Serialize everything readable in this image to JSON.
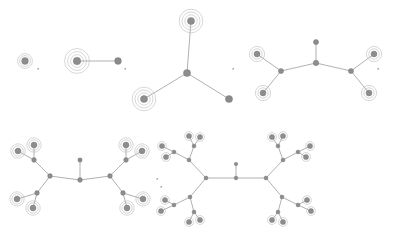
{
  "figure": {
    "kind": "graph-sequence",
    "background": "#ffffff",
    "node_color": "#8d8d8d",
    "node_stroke": "#6f6f6f",
    "edge_color": "#8f8f8f",
    "halo_color": "#b6b6b6",
    "comma_color": "#6a6a6a",
    "separator": ",",
    "width": 402,
    "height": 231
  },
  "separators": [
    {
      "name": "comma-1",
      "x": 37,
      "y": 62,
      "text": ","
    },
    {
      "name": "comma-2",
      "x": 124,
      "y": 62,
      "text": ","
    },
    {
      "name": "comma-3",
      "x": 232,
      "y": 62,
      "text": ","
    },
    {
      "name": "comma-4",
      "x": 377,
      "y": 62,
      "text": ","
    },
    {
      "name": "comma-5",
      "x": 160,
      "y": 180,
      "text": ","
    },
    {
      "name": "comma-6",
      "x": 156,
      "y": 172,
      "text": ","
    }
  ],
  "graphs": [
    {
      "name": "graph-1-single-haloed-node",
      "nodes": [
        {
          "x": 25,
          "y": 61,
          "r": 3.4,
          "halos": [
            5.4,
            7.4
          ],
          "type": "leaf"
        }
      ],
      "edges": []
    },
    {
      "name": "graph-2-two-node-edge",
      "nodes": [
        {
          "x": 77,
          "y": 61,
          "r": 3.8,
          "halos": [
            6.4,
            9.4,
            12.4
          ],
          "type": "leaf"
        },
        {
          "x": 118,
          "y": 61,
          "r": 3.4,
          "halos": [],
          "type": "plain"
        }
      ],
      "edges": [
        [
          0,
          1
        ]
      ]
    },
    {
      "name": "graph-3-three-branch-star",
      "nodes": [
        {
          "x": 187,
          "y": 73,
          "r": 3.6,
          "halos": [],
          "type": "center"
        },
        {
          "x": 191,
          "y": 21,
          "r": 3.6,
          "halos": [
            6.2,
            9.0,
            11.8
          ],
          "type": "leaf"
        },
        {
          "x": 144,
          "y": 99,
          "r": 3.6,
          "halos": [
            6.2,
            9.0,
            11.8
          ],
          "type": "leaf"
        },
        {
          "x": 229,
          "y": 99,
          "r": 3.6,
          "halos": [],
          "type": "plain"
        }
      ],
      "edges": [
        [
          0,
          1
        ],
        [
          0,
          2
        ],
        [
          0,
          3
        ]
      ]
    },
    {
      "name": "graph-4-caterpillar-seven-node",
      "nodes": [
        {
          "x": 316,
          "y": 63,
          "r": 2.8,
          "halos": [],
          "type": "center"
        },
        {
          "x": 316,
          "y": 42,
          "r": 2.6,
          "halos": [],
          "type": "plain"
        },
        {
          "x": 281,
          "y": 71,
          "r": 2.6,
          "halos": [],
          "type": "branch"
        },
        {
          "x": 351,
          "y": 71,
          "r": 2.6,
          "halos": [],
          "type": "branch"
        },
        {
          "x": 257,
          "y": 54,
          "r": 3.0,
          "halos": [
            5.2,
            7.6
          ],
          "type": "leaf"
        },
        {
          "x": 263,
          "y": 93,
          "r": 3.0,
          "halos": [
            5.2,
            7.6
          ],
          "type": "leaf"
        },
        {
          "x": 374,
          "y": 54,
          "r": 3.0,
          "halos": [
            5.2,
            7.6
          ],
          "type": "leaf"
        },
        {
          "x": 369,
          "y": 93,
          "r": 3.0,
          "halos": [
            5.2,
            7.6
          ],
          "type": "leaf"
        }
      ],
      "edges": [
        [
          0,
          1
        ],
        [
          0,
          2
        ],
        [
          0,
          3
        ],
        [
          2,
          4
        ],
        [
          2,
          5
        ],
        [
          3,
          6
        ],
        [
          3,
          7
        ]
      ]
    },
    {
      "name": "graph-5-symmetric-tree-depth-two",
      "nodes": [
        {
          "x": 80,
          "y": 180,
          "r": 2.4,
          "halos": [],
          "type": "center"
        },
        {
          "x": 80,
          "y": 160,
          "r": 2.2,
          "halos": [],
          "type": "plain"
        },
        {
          "x": 50,
          "y": 176,
          "r": 2.4,
          "halos": [],
          "type": "branch"
        },
        {
          "x": 110,
          "y": 176,
          "r": 2.4,
          "halos": [],
          "type": "branch"
        },
        {
          "x": 34,
          "y": 160,
          "r": 2.4,
          "halos": [],
          "type": "branch"
        },
        {
          "x": 37,
          "y": 193,
          "r": 2.4,
          "halos": [],
          "type": "branch"
        },
        {
          "x": 126,
          "y": 160,
          "r": 2.4,
          "halos": [],
          "type": "branch"
        },
        {
          "x": 123,
          "y": 193,
          "r": 2.4,
          "halos": [],
          "type": "branch"
        },
        {
          "x": 18,
          "y": 151,
          "r": 3.0,
          "halos": [
            5.2,
            7.2
          ],
          "type": "leaf"
        },
        {
          "x": 34,
          "y": 145,
          "r": 3.0,
          "halos": [
            5.2,
            7.2
          ],
          "type": "leaf"
        },
        {
          "x": 17,
          "y": 199,
          "r": 3.0,
          "halos": [
            5.2,
            7.2
          ],
          "type": "leaf"
        },
        {
          "x": 33,
          "y": 208,
          "r": 3.0,
          "halos": [
            5.2,
            7.2
          ],
          "type": "leaf"
        },
        {
          "x": 142,
          "y": 151,
          "r": 3.0,
          "halos": [
            5.2,
            7.2
          ],
          "type": "leaf"
        },
        {
          "x": 126,
          "y": 145,
          "r": 3.0,
          "halos": [
            5.2,
            7.2
          ],
          "type": "leaf"
        },
        {
          "x": 143,
          "y": 199,
          "r": 3.0,
          "halos": [
            5.2,
            7.2
          ],
          "type": "leaf"
        },
        {
          "x": 127,
          "y": 208,
          "r": 3.0,
          "halos": [
            5.2,
            7.2
          ],
          "type": "leaf"
        }
      ],
      "edges": [
        [
          0,
          1
        ],
        [
          0,
          2
        ],
        [
          0,
          3
        ],
        [
          2,
          4
        ],
        [
          2,
          5
        ],
        [
          3,
          6
        ],
        [
          3,
          7
        ],
        [
          4,
          8
        ],
        [
          4,
          9
        ],
        [
          5,
          10
        ],
        [
          5,
          11
        ],
        [
          6,
          12
        ],
        [
          6,
          13
        ],
        [
          7,
          14
        ],
        [
          7,
          15
        ]
      ]
    },
    {
      "name": "graph-6-symmetric-tree-depth-three",
      "nodes": [
        {
          "x": 236,
          "y": 178,
          "r": 1.9,
          "halos": [],
          "type": "center"
        },
        {
          "x": 236,
          "y": 164,
          "r": 1.8,
          "halos": [],
          "type": "plain"
        },
        {
          "x": 206,
          "y": 178,
          "r": 2.0,
          "halos": [],
          "type": "branch"
        },
        {
          "x": 266,
          "y": 178,
          "r": 2.0,
          "halos": [],
          "type": "branch"
        },
        {
          "x": 189,
          "y": 160,
          "r": 2.0,
          "halos": [],
          "type": "branch"
        },
        {
          "x": 190,
          "y": 197,
          "r": 2.0,
          "halos": [],
          "type": "branch"
        },
        {
          "x": 283,
          "y": 160,
          "r": 2.0,
          "halos": [],
          "type": "branch"
        },
        {
          "x": 282,
          "y": 197,
          "r": 2.0,
          "halos": [],
          "type": "branch"
        },
        {
          "x": 174,
          "y": 152,
          "r": 2.0,
          "halos": [],
          "type": "branch"
        },
        {
          "x": 194,
          "y": 146,
          "r": 2.0,
          "halos": [],
          "type": "branch"
        },
        {
          "x": 174,
          "y": 205,
          "r": 2.0,
          "halos": [],
          "type": "branch"
        },
        {
          "x": 194,
          "y": 212,
          "r": 2.0,
          "halos": [],
          "type": "branch"
        },
        {
          "x": 298,
          "y": 152,
          "r": 2.0,
          "halos": [],
          "type": "branch"
        },
        {
          "x": 278,
          "y": 146,
          "r": 2.0,
          "halos": [],
          "type": "branch"
        },
        {
          "x": 298,
          "y": 205,
          "r": 2.0,
          "halos": [],
          "type": "branch"
        },
        {
          "x": 278,
          "y": 212,
          "r": 2.0,
          "halos": [],
          "type": "branch"
        },
        {
          "x": 162,
          "y": 146,
          "r": 2.6,
          "halos": [
            4.4
          ],
          "type": "leaf"
        },
        {
          "x": 166,
          "y": 157,
          "r": 2.6,
          "halos": [
            4.4
          ],
          "type": "leaf"
        },
        {
          "x": 189,
          "y": 136,
          "r": 2.6,
          "halos": [
            4.4
          ],
          "type": "leaf"
        },
        {
          "x": 200,
          "y": 137,
          "r": 2.6,
          "halos": [
            4.4
          ],
          "type": "leaf"
        },
        {
          "x": 161,
          "y": 211,
          "r": 2.6,
          "halos": [
            4.4
          ],
          "type": "leaf"
        },
        {
          "x": 165,
          "y": 200,
          "r": 2.6,
          "halos": [
            4.4
          ],
          "type": "leaf"
        },
        {
          "x": 189,
          "y": 222,
          "r": 2.6,
          "halos": [
            4.4
          ],
          "type": "leaf"
        },
        {
          "x": 200,
          "y": 220,
          "r": 2.6,
          "halos": [
            4.4
          ],
          "type": "leaf"
        },
        {
          "x": 310,
          "y": 146,
          "r": 2.6,
          "halos": [
            4.4
          ],
          "type": "leaf"
        },
        {
          "x": 306,
          "y": 157,
          "r": 2.6,
          "halos": [
            4.4
          ],
          "type": "leaf"
        },
        {
          "x": 283,
          "y": 136,
          "r": 2.6,
          "halos": [
            4.4
          ],
          "type": "leaf"
        },
        {
          "x": 272,
          "y": 137,
          "r": 2.6,
          "halos": [
            4.4
          ],
          "type": "leaf"
        },
        {
          "x": 311,
          "y": 211,
          "r": 2.6,
          "halos": [
            4.4
          ],
          "type": "leaf"
        },
        {
          "x": 307,
          "y": 200,
          "r": 2.6,
          "halos": [
            4.4
          ],
          "type": "leaf"
        },
        {
          "x": 283,
          "y": 222,
          "r": 2.6,
          "halos": [
            4.4
          ],
          "type": "leaf"
        },
        {
          "x": 272,
          "y": 220,
          "r": 2.6,
          "halos": [
            4.4
          ],
          "type": "leaf"
        }
      ],
      "edges": [
        [
          0,
          1
        ],
        [
          0,
          2
        ],
        [
          0,
          3
        ],
        [
          2,
          4
        ],
        [
          2,
          5
        ],
        [
          3,
          6
        ],
        [
          3,
          7
        ],
        [
          4,
          8
        ],
        [
          4,
          9
        ],
        [
          5,
          10
        ],
        [
          5,
          11
        ],
        [
          6,
          12
        ],
        [
          6,
          13
        ],
        [
          7,
          14
        ],
        [
          7,
          15
        ],
        [
          8,
          16
        ],
        [
          8,
          17
        ],
        [
          9,
          18
        ],
        [
          9,
          19
        ],
        [
          10,
          20
        ],
        [
          10,
          21
        ],
        [
          11,
          22
        ],
        [
          11,
          23
        ],
        [
          12,
          24
        ],
        [
          12,
          25
        ],
        [
          13,
          26
        ],
        [
          13,
          27
        ],
        [
          14,
          28
        ],
        [
          14,
          29
        ],
        [
          15,
          30
        ],
        [
          15,
          31
        ]
      ]
    }
  ]
}
